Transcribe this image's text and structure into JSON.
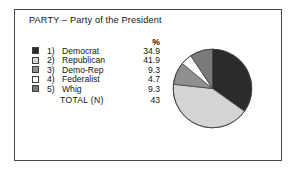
{
  "title": "PARTY – Party of the President",
  "table": {
    "percent_header": "%",
    "rows": [
      {
        "index": "1)",
        "label": "Democrat",
        "percent": "34.9",
        "swatch": "dark"
      },
      {
        "index": "2)",
        "label": "Republican",
        "percent": "41.9",
        "swatch": "light"
      },
      {
        "index": "3)",
        "label": "Demo-Rep",
        "percent": "9.3",
        "swatch": "medium"
      },
      {
        "index": "4)",
        "label": "Federalist",
        "percent": "4.7",
        "swatch": "white"
      },
      {
        "index": "5)",
        "label": "Whig",
        "percent": "9.3",
        "swatch": "medgray"
      }
    ],
    "total_label": "TOTAL  (N)",
    "total_value": "43"
  },
  "colors": {
    "dark": "#2b2b2b",
    "light": "#d4d4d4",
    "medium": "#8f8f8f",
    "white": "#ffffff",
    "medgray": "#7a7a7a",
    "outline": "#3d3d3d",
    "frame": "#4a4a4a"
  },
  "chart_data": {
    "type": "pie",
    "title": "PARTY – Party of the President",
    "labels": [
      "Democrat",
      "Republican",
      "Demo-Rep",
      "Federalist",
      "Whig"
    ],
    "values": [
      34.9,
      41.9,
      9.3,
      4.7,
      9.3
    ],
    "value_unit": "percent",
    "total_n": 43,
    "start_angle_deg": 0,
    "direction": "clockwise",
    "legend_position": "left",
    "slice_colors": [
      "#2b2b2b",
      "#d4d4d4",
      "#8f8f8f",
      "#ffffff",
      "#7a7a7a"
    ]
  }
}
